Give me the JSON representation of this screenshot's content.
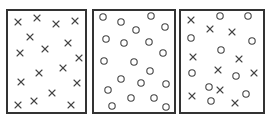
{
  "colors": {
    "background": "#ffffff",
    "border": "#333333",
    "marker": "#444444"
  },
  "panels": [
    {
      "id": "panel-crosses",
      "box": {
        "x": 7,
        "y": 10,
        "w": 79,
        "h": 103
      },
      "crosses": [
        [
          18,
          22
        ],
        [
          37,
          18
        ],
        [
          56,
          24
        ],
        [
          75,
          21
        ],
        [
          30,
          37
        ],
        [
          68,
          43
        ],
        [
          20,
          53
        ],
        [
          45,
          49
        ],
        [
          79,
          58
        ],
        [
          63,
          68
        ],
        [
          39,
          73
        ],
        [
          21,
          82
        ],
        [
          77,
          83
        ],
        [
          52,
          93
        ],
        [
          18,
          105
        ],
        [
          34,
          101
        ],
        [
          71,
          105
        ]
      ],
      "circles": []
    },
    {
      "id": "panel-circles",
      "box": {
        "x": 93,
        "y": 10,
        "w": 82,
        "h": 103
      },
      "crosses": [],
      "circles": [
        [
          103,
          17
        ],
        [
          121,
          22
        ],
        [
          136,
          30
        ],
        [
          151,
          16
        ],
        [
          165,
          27
        ],
        [
          106,
          39
        ],
        [
          124,
          43
        ],
        [
          149,
          42
        ],
        [
          163,
          53
        ],
        [
          104,
          61
        ],
        [
          134,
          62
        ],
        [
          150,
          71
        ],
        [
          121,
          79
        ],
        [
          141,
          83
        ],
        [
          166,
          84
        ],
        [
          108,
          90
        ],
        [
          131,
          98
        ],
        [
          154,
          98
        ],
        [
          112,
          106
        ],
        [
          166,
          107
        ]
      ]
    },
    {
      "id": "panel-mixed",
      "box": {
        "x": 180,
        "y": 10,
        "w": 84,
        "h": 103
      },
      "crosses": [
        [
          191,
          20
        ],
        [
          210,
          29
        ],
        [
          232,
          32
        ],
        [
          193,
          57
        ],
        [
          239,
          59
        ],
        [
          218,
          70
        ],
        [
          254,
          73
        ],
        [
          192,
          96
        ],
        [
          220,
          90
        ],
        [
          235,
          103
        ]
      ],
      "circles": [
        [
          220,
          16
        ],
        [
          248,
          16
        ],
        [
          191,
          38
        ],
        [
          252,
          41
        ],
        [
          221,
          50
        ],
        [
          192,
          73
        ],
        [
          236,
          76
        ],
        [
          209,
          87
        ],
        [
          246,
          94
        ],
        [
          211,
          101
        ]
      ]
    }
  ]
}
